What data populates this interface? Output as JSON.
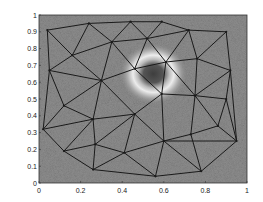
{
  "chart_data": {
    "type": "mesh",
    "title": "",
    "xlabel": "",
    "ylabel": "",
    "xlim": [
      0,
      1
    ],
    "ylim": [
      0,
      1
    ],
    "grid": false,
    "x_ticks": [
      "0",
      "0.2",
      "0.4",
      "0.6",
      "0.8",
      "1"
    ],
    "y_ticks": [
      "0",
      "0.1",
      "0.2",
      "0.3",
      "0.4",
      "0.5",
      "0.6",
      "0.7",
      "0.8",
      "0.9",
      "1"
    ],
    "background": {
      "description": "noisy grayscale image with bright ring and dark core",
      "ring_center": [
        0.55,
        0.65
      ],
      "ring_radius": 0.12,
      "core_color": "#4a4a4a",
      "ring_color": "#e6e6e6",
      "base_color": "#8a8a8a"
    },
    "nodes": {
      "A": [
        0.04,
        0.91
      ],
      "B": [
        0.24,
        0.95
      ],
      "C": [
        0.44,
        0.96
      ],
      "D": [
        0.59,
        0.96
      ],
      "E": [
        0.72,
        0.91
      ],
      "F": [
        0.9,
        0.9
      ],
      "G": [
        0.16,
        0.76
      ],
      "H": [
        0.35,
        0.84
      ],
      "I": [
        0.52,
        0.86
      ],
      "J": [
        0.05,
        0.67
      ],
      "K": [
        0.3,
        0.61
      ],
      "L": [
        0.46,
        0.68
      ],
      "M": [
        0.61,
        0.72
      ],
      "N": [
        0.76,
        0.74
      ],
      "O": [
        0.92,
        0.67
      ],
      "P": [
        0.12,
        0.46
      ],
      "Q": [
        0.59,
        0.53
      ],
      "R": [
        0.75,
        0.52
      ],
      "S": [
        0.9,
        0.5
      ],
      "T": [
        0.26,
        0.38
      ],
      "U": [
        0.46,
        0.41
      ],
      "V": [
        0.02,
        0.32
      ],
      "W": [
        0.27,
        0.23
      ],
      "X": [
        0.41,
        0.18
      ],
      "Y": [
        0.6,
        0.25
      ],
      "Z": [
        0.73,
        0.29
      ],
      "AA": [
        0.86,
        0.34
      ],
      "AB": [
        0.95,
        0.25
      ],
      "AC": [
        0.12,
        0.19
      ],
      "AD": [
        0.26,
        0.08
      ],
      "AE": [
        0.56,
        0.04
      ],
      "AF": [
        0.78,
        0.07
      ]
    },
    "edges": [
      [
        "A",
        "B"
      ],
      [
        "B",
        "C"
      ],
      [
        "C",
        "D"
      ],
      [
        "D",
        "E"
      ],
      [
        "E",
        "F"
      ],
      [
        "A",
        "G"
      ],
      [
        "B",
        "G"
      ],
      [
        "B",
        "H"
      ],
      [
        "C",
        "H"
      ],
      [
        "C",
        "I"
      ],
      [
        "D",
        "I"
      ],
      [
        "E",
        "I"
      ],
      [
        "E",
        "M"
      ],
      [
        "E",
        "N"
      ],
      [
        "F",
        "N"
      ],
      [
        "F",
        "O"
      ],
      [
        "G",
        "H"
      ],
      [
        "H",
        "I"
      ],
      [
        "I",
        "M"
      ],
      [
        "M",
        "N"
      ],
      [
        "N",
        "O"
      ],
      [
        "A",
        "J"
      ],
      [
        "G",
        "J"
      ],
      [
        "G",
        "K"
      ],
      [
        "H",
        "K"
      ],
      [
        "H",
        "L"
      ],
      [
        "I",
        "L"
      ],
      [
        "L",
        "M"
      ],
      [
        "J",
        "K"
      ],
      [
        "K",
        "L"
      ],
      [
        "L",
        "Q"
      ],
      [
        "M",
        "Q"
      ],
      [
        "M",
        "R"
      ],
      [
        "N",
        "R"
      ],
      [
        "O",
        "R"
      ],
      [
        "O",
        "S"
      ],
      [
        "J",
        "P"
      ],
      [
        "K",
        "P"
      ],
      [
        "K",
        "T"
      ],
      [
        "K",
        "U"
      ],
      [
        "Q",
        "R"
      ],
      [
        "R",
        "S"
      ],
      [
        "P",
        "T"
      ],
      [
        "T",
        "U"
      ],
      [
        "U",
        "Q"
      ],
      [
        "Q",
        "Y"
      ],
      [
        "R",
        "Z"
      ],
      [
        "R",
        "AA"
      ],
      [
        "S",
        "AA"
      ],
      [
        "S",
        "AB"
      ],
      [
        "J",
        "V"
      ],
      [
        "P",
        "V"
      ],
      [
        "V",
        "T"
      ],
      [
        "V",
        "AC"
      ],
      [
        "T",
        "W"
      ],
      [
        "T",
        "AC"
      ],
      [
        "U",
        "W"
      ],
      [
        "U",
        "X"
      ],
      [
        "U",
        "Y"
      ],
      [
        "W",
        "AC"
      ],
      [
        "W",
        "X"
      ],
      [
        "X",
        "Y"
      ],
      [
        "Y",
        "Z"
      ],
      [
        "Z",
        "AA"
      ],
      [
        "AA",
        "AB"
      ],
      [
        "AC",
        "AD"
      ],
      [
        "W",
        "AD"
      ],
      [
        "X",
        "AD"
      ],
      [
        "X",
        "AE"
      ],
      [
        "Y",
        "AE"
      ],
      [
        "Y",
        "AF"
      ],
      [
        "Z",
        "AF"
      ],
      [
        "AB",
        "AF"
      ],
      [
        "AB",
        "Y"
      ],
      [
        "AD",
        "AE"
      ],
      [
        "AE",
        "AF"
      ],
      [
        "O",
        "AB"
      ]
    ]
  }
}
